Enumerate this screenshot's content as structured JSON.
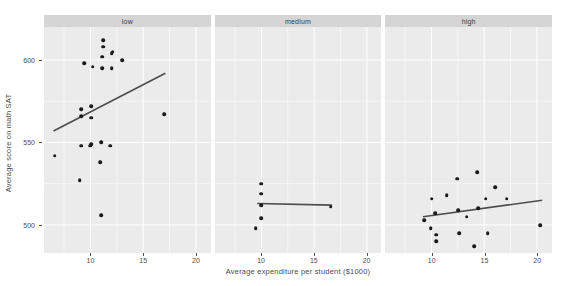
{
  "chart_data": {
    "type": "scatter",
    "title": "",
    "xlabel": "Average expenditure per student ($1000)",
    "ylabel": "Average score on math SAT",
    "xlim": [
      5.6,
      21.4
    ],
    "ylim": [
      483,
      620
    ],
    "xticks": [
      10,
      15,
      20
    ],
    "yticks": [
      500,
      550,
      600
    ],
    "grid": true,
    "legend": "none",
    "facet_variable": "percent taking SAT",
    "facets": [
      {
        "label": "low",
        "points": [
          {
            "x": 6.6,
            "y": 542
          },
          {
            "x": 9.0,
            "y": 527
          },
          {
            "x": 9.1,
            "y": 548
          },
          {
            "x": 9.1,
            "y": 566
          },
          {
            "x": 9.1,
            "y": 570
          },
          {
            "x": 9.4,
            "y": 598
          },
          {
            "x": 10.0,
            "y": 548
          },
          {
            "x": 10.1,
            "y": 549
          },
          {
            "x": 10.1,
            "y": 565
          },
          {
            "x": 10.1,
            "y": 572
          },
          {
            "x": 10.2,
            "y": 596
          },
          {
            "x": 10.9,
            "y": 538
          },
          {
            "x": 11.0,
            "y": 550
          },
          {
            "x": 11.0,
            "y": 506
          },
          {
            "x": 11.1,
            "y": 595
          },
          {
            "x": 11.1,
            "y": 602
          },
          {
            "x": 11.2,
            "y": 608
          },
          {
            "x": 11.2,
            "y": 612
          },
          {
            "x": 11.9,
            "y": 548
          },
          {
            "x": 12.0,
            "y": 595
          },
          {
            "x": 12.0,
            "y": 604
          },
          {
            "x": 12.1,
            "y": 605
          },
          {
            "x": 13.0,
            "y": 600
          },
          {
            "x": 17.0,
            "y": 567
          }
        ],
        "fit_line": {
          "x1": 6.5,
          "y1": 557,
          "x2": 17.1,
          "y2": 592
        }
      },
      {
        "label": "medium",
        "points": [
          {
            "x": 9.5,
            "y": 498
          },
          {
            "x": 10.0,
            "y": 504
          },
          {
            "x": 10.0,
            "y": 512
          },
          {
            "x": 10.0,
            "y": 519
          },
          {
            "x": 10.0,
            "y": 525
          },
          {
            "x": 16.6,
            "y": 511
          }
        ],
        "fit_line": {
          "x1": 9.6,
          "y1": 513,
          "x2": 16.7,
          "y2": 512
        }
      },
      {
        "label": "high",
        "points": [
          {
            "x": 9.3,
            "y": 503
          },
          {
            "x": 9.9,
            "y": 498
          },
          {
            "x": 10.0,
            "y": 516
          },
          {
            "x": 10.3,
            "y": 507
          },
          {
            "x": 10.4,
            "y": 494
          },
          {
            "x": 10.4,
            "y": 490
          },
          {
            "x": 11.4,
            "y": 518
          },
          {
            "x": 12.4,
            "y": 528
          },
          {
            "x": 12.5,
            "y": 509
          },
          {
            "x": 12.6,
            "y": 495
          },
          {
            "x": 13.3,
            "y": 505
          },
          {
            "x": 14.0,
            "y": 487
          },
          {
            "x": 14.3,
            "y": 532
          },
          {
            "x": 14.4,
            "y": 510
          },
          {
            "x": 15.1,
            "y": 516
          },
          {
            "x": 15.3,
            "y": 495
          },
          {
            "x": 16.0,
            "y": 523
          },
          {
            "x": 17.1,
            "y": 516
          },
          {
            "x": 20.3,
            "y": 500
          }
        ],
        "fit_line": {
          "x1": 9.2,
          "y1": 505,
          "x2": 20.5,
          "y2": 515
        }
      }
    ],
    "style": {
      "panel_background": "#ebebeb",
      "strip_background": "#d5d5d5",
      "grid_color": "#ffffff",
      "point_color": "#1a1a1a",
      "line_color": "#4d4d4d",
      "text_color": "#4d4d4d",
      "plot_background": "#ffffff"
    }
  }
}
